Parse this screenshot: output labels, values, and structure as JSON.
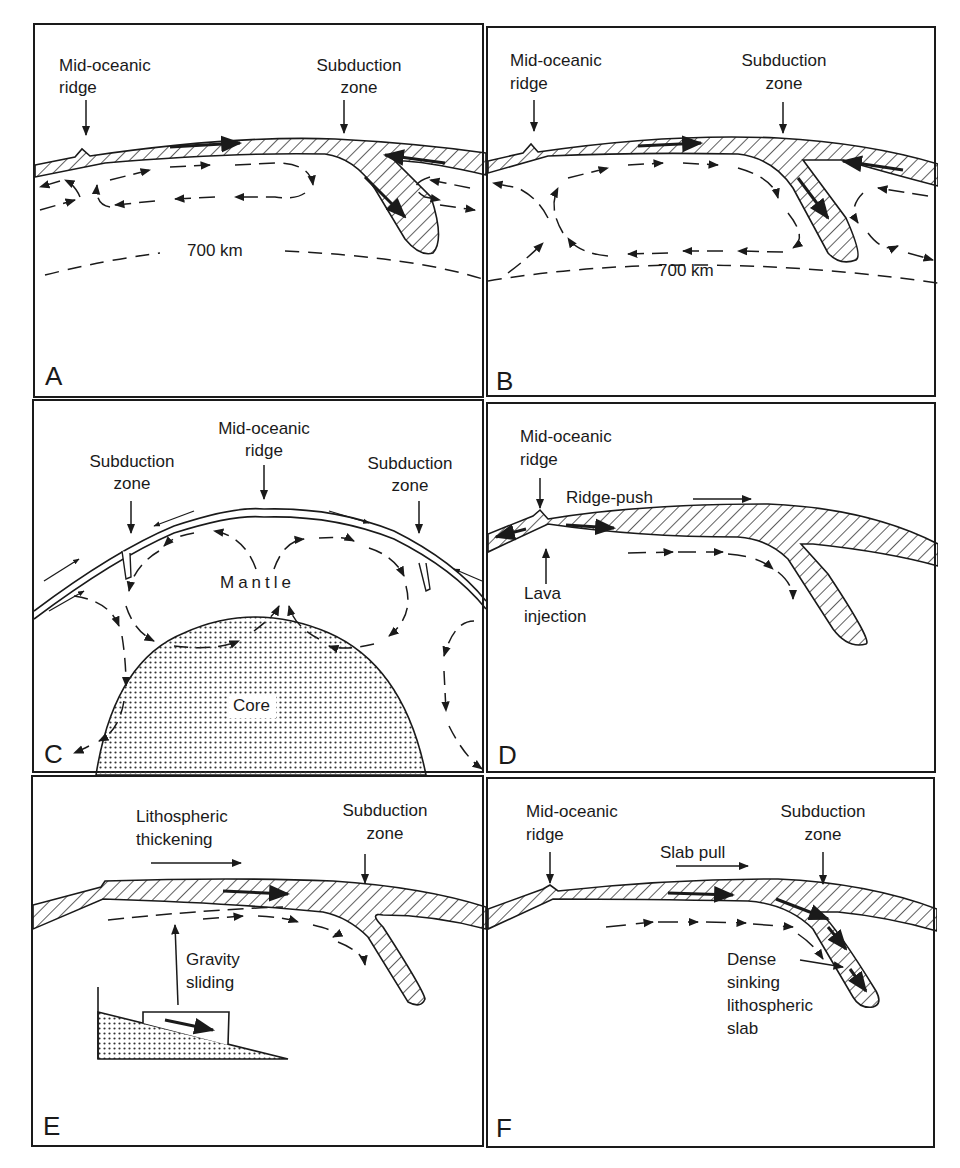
{
  "figure": {
    "colors": {
      "ink": "#1a1a1a",
      "background": "#ffffff"
    }
  },
  "panels": {
    "A": {
      "letter": "A",
      "ridge_label": [
        "Mid-oceanic",
        "ridge"
      ],
      "subduction_label": [
        "Subduction",
        "zone"
      ],
      "depth_label": "700 km"
    },
    "B": {
      "letter": "B",
      "ridge_label": [
        "Mid-oceanic",
        "ridge"
      ],
      "subduction_label": [
        "Subduction",
        "zone"
      ],
      "depth_label": "700 km"
    },
    "C": {
      "letter": "C",
      "ridge_label": [
        "Mid-oceanic",
        "ridge"
      ],
      "left_subduction_label": [
        "Subduction",
        "zone"
      ],
      "right_subduction_label": [
        "Subduction",
        "zone"
      ],
      "mantle_label": "Mantle",
      "core_label": "Core"
    },
    "D": {
      "letter": "D",
      "ridge_label": [
        "Mid-oceanic",
        "ridge"
      ],
      "ridge_push_label": "Ridge-push",
      "lava_label": [
        "Lava",
        "injection"
      ]
    },
    "E": {
      "letter": "E",
      "thickening_label": [
        "Lithospheric",
        "thickening"
      ],
      "subduction_label": [
        "Subduction",
        "zone"
      ],
      "gravity_label": [
        "Gravity",
        "sliding"
      ]
    },
    "F": {
      "letter": "F",
      "ridge_label": [
        "Mid-oceanic",
        "ridge"
      ],
      "subduction_label": [
        "Subduction",
        "zone"
      ],
      "slab_pull_label": "Slab pull",
      "slab_label": [
        "Dense",
        "sinking",
        "lithospheric",
        "slab"
      ]
    }
  }
}
